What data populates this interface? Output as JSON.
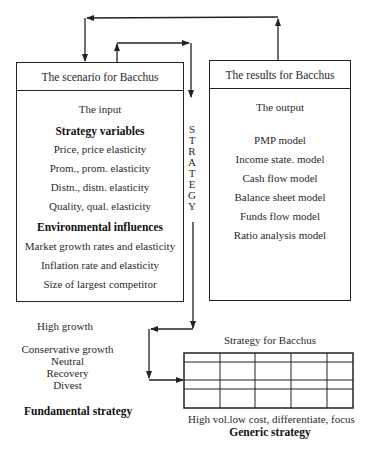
{
  "scenario_box": {
    "title": "The scenario for Bacchus",
    "subtitle": "The input",
    "sections": [
      {
        "heading": "Strategy variables",
        "items": [
          "Price, price elasticity",
          "Prom., prom.  elasticity",
          "Distn., distn. elasticity",
          "Quality, qual. elasticity"
        ]
      },
      {
        "heading": "Environmental influences",
        "items": [
          "Market growth rates and elasticity",
          "Inflation rate and elasticity",
          "Size of largest competitor"
        ]
      }
    ]
  },
  "results_box": {
    "title": "The results for Bacchus",
    "subtitle": "The output",
    "items": [
      "PMP model",
      "Income state. model",
      "Cash flow model",
      "Balance sheet model",
      "Funds flow model",
      "Ratio analysis model"
    ]
  },
  "strategy_label": [
    "S",
    "T",
    "R",
    "A",
    "T",
    "E",
    "G",
    "Y"
  ],
  "fundamental_strategy": {
    "options": [
      "High growth",
      "Conservative growth",
      "Neutral",
      "Recovery",
      "Divest"
    ],
    "label": "Fundamental strategy"
  },
  "generic_strategy": {
    "title": "Strategy for Bacchus",
    "grid": {
      "columns": 5,
      "rows": 4
    },
    "caption": "High vol.low cost, differentiate, focus",
    "label": "Generic strategy"
  },
  "colors": {
    "line": "#222222",
    "text": "#2a2a2a"
  }
}
